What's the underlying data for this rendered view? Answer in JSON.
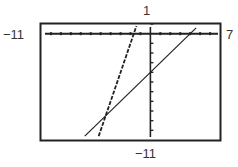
{
  "chart_data": {
    "type": "line",
    "title": "",
    "xlabel": "",
    "ylabel": "",
    "window": {
      "xmin": -11,
      "xmax": 7,
      "ymin": -11,
      "ymax": 1,
      "xscl": 1,
      "yscl": 1
    },
    "xlim": [
      -11,
      7
    ],
    "ylim": [
      -11,
      1
    ],
    "grid": false,
    "legend": null,
    "tick_labels": {
      "xmin": "−11",
      "xmax": "7",
      "ymin": "−11",
      "ymax": "1"
    },
    "series": [
      {
        "name": "solid line",
        "style": "solid",
        "slope": 1,
        "intercept": -4,
        "points": [
          [
            -6.6,
            -10.6
          ],
          [
            4.6,
            0.6
          ]
        ]
      },
      {
        "name": "dashed line",
        "style": "dashed",
        "slope": 3,
        "intercept": 5,
        "points": [
          [
            -5.2,
            -10.6
          ],
          [
            -1.4,
            0.8
          ]
        ]
      }
    ],
    "annotations": [
      {
        "type": "intersection",
        "x": -4.5,
        "y": -8.5
      }
    ]
  }
}
